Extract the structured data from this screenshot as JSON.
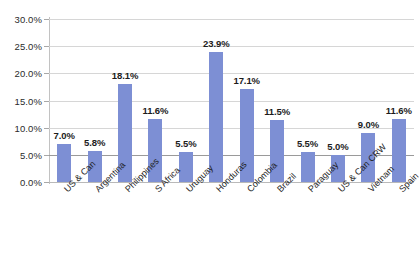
{
  "chart_data": {
    "type": "bar",
    "title": "",
    "subtitle": "",
    "xlabel": "",
    "ylabel": "",
    "categories": [
      "US & Can",
      "Argentina",
      "Philippines",
      "S Africa",
      "Uruguay",
      "Honduras",
      "Colombia",
      "Brazil",
      "Paraguay",
      "US & Can CRW",
      "Vietnam",
      "Spain"
    ],
    "values": [
      7.0,
      5.8,
      18.1,
      11.6,
      5.5,
      23.9,
      17.1,
      11.5,
      5.5,
      5.0,
      9.0,
      11.6
    ],
    "data_labels": [
      "7.0%",
      "5.8%",
      "18.1%",
      "11.6%",
      "5.5%",
      "23.9%",
      "17.1%",
      "11.5%",
      "5.5%",
      "5.0%",
      "9.0%",
      "11.6%"
    ],
    "ylim": [
      0,
      30
    ],
    "ytick_values": [
      0,
      5,
      10,
      15,
      20,
      25,
      30
    ],
    "ytick_labels": [
      "0.0%",
      "5.0%",
      "10.0%",
      "15.0%",
      "20.0%",
      "25.0%",
      "30.0%"
    ],
    "grid": true,
    "legend": false,
    "series_color": "#7d8fd4",
    "gridline_color": "#d6d6d6",
    "axis_color": "#c2c2c2"
  }
}
